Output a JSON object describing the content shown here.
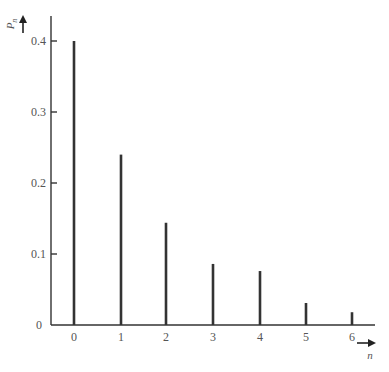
{
  "chart_data": {
    "type": "bar",
    "style": "stem",
    "title": "",
    "xlabel": "n",
    "ylabel": "P_n",
    "ylabel_main": "P",
    "ylabel_sub": "n",
    "categories": [
      "0",
      "1",
      "2",
      "3",
      "4",
      "5",
      "6"
    ],
    "values": [
      0.4,
      0.24,
      0.144,
      0.086,
      0.076,
      0.031,
      0.018
    ],
    "ylim": [
      0,
      0.44
    ],
    "yticks": [
      0,
      0.1,
      0.2,
      0.3,
      0.4
    ],
    "ytick_labels": [
      "0",
      "0.1",
      "0.2",
      "0.3",
      "0.4"
    ],
    "grid": false,
    "legend": null
  },
  "colors": {
    "stroke": "#333333",
    "text": "#555555",
    "background": "#ffffff"
  }
}
